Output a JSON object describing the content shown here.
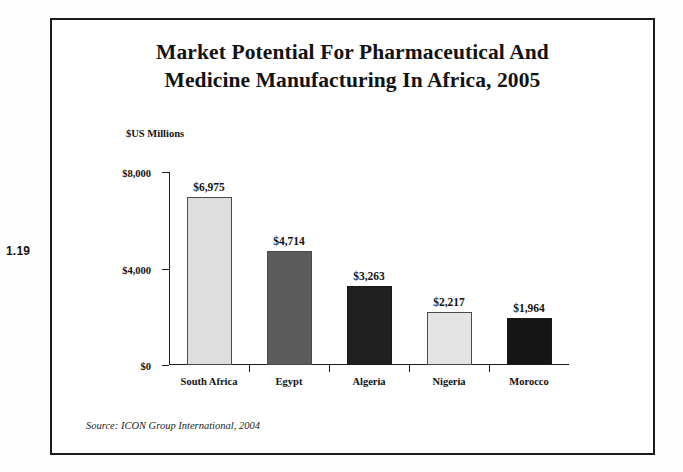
{
  "page_marker": "1.19",
  "figure": {
    "title_line1": "Market Potential For Pharmaceutical And",
    "title_line2": "Medicine Manufacturing In Africa, 2005",
    "source_note": "Source: ICON Group International, 2004"
  },
  "chart_data": {
    "type": "bar",
    "title": "Market Potential For Pharmaceutical And Medicine Manufacturing In Africa, 2005",
    "categories": [
      "South Africa",
      "Egypt",
      "Algeria",
      "Nigeria",
      "Morocco"
    ],
    "values": [
      6975,
      4714,
      3263,
      2217,
      1964
    ],
    "value_labels": [
      "$6,975",
      "$4,714",
      "$3,263",
      "$2,217",
      "$1,964"
    ],
    "bar_colors": [
      "#dedede",
      "#5c5c5c",
      "#202020",
      "#e4e4e4",
      "#151515"
    ],
    "xlabel": "",
    "ylabel": "$US Millions",
    "ylim": [
      0,
      8000
    ],
    "ytick_values": [
      0,
      4000,
      8000
    ],
    "ytick_labels": [
      "$0",
      "$4,000",
      "$8,000"
    ],
    "grid": false,
    "legend": "none",
    "source": "ICON Group International, 2004"
  }
}
